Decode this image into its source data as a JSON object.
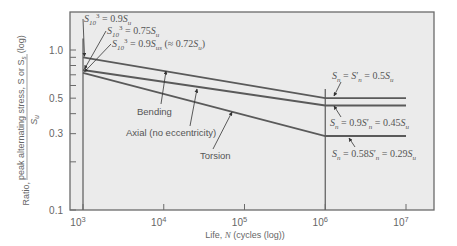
{
  "chart_data": {
    "type": "line",
    "title": "",
    "xlabel": "Life, N (cycles (log))",
    "ylabel": "Ratio, peak alternating stress, S or S_s / S_u (log)",
    "ylabel_parts": {
      "prefix": "Ratio,",
      "numerator": "peak alternating stress, S or S",
      "numerator_sub": "s",
      "denominator": "S",
      "denominator_sub": "u",
      "suffix": "(log)"
    },
    "xscale": "log",
    "yscale": "log",
    "xlim": [
      1000,
      20000000
    ],
    "ylim": [
      0.1,
      1.35
    ],
    "grid": false,
    "x_ticks": [
      {
        "value": 1000,
        "label_base": "10",
        "label_exp": "3"
      },
      {
        "value": 10000,
        "label_base": "10",
        "label_exp": "4"
      },
      {
        "value": 100000,
        "label_base": "10",
        "label_exp": "5"
      },
      {
        "value": 1000000,
        "label_base": "10",
        "label_exp": "6"
      },
      {
        "value": 10000000,
        "label_base": "10",
        "label_exp": "7"
      }
    ],
    "y_ticks_major": [
      {
        "value": 1.0,
        "label": "1.0"
      },
      {
        "value": 0.5,
        "label": "0.5"
      },
      {
        "value": 0.3,
        "label": "0.3"
      },
      {
        "value": 0.1,
        "label": "0.1"
      }
    ],
    "y_ticks_minor": [
      0.9,
      0.8,
      0.7,
      0.6,
      0.4,
      0.2
    ],
    "series": [
      {
        "name": "Bending",
        "x": [
          1000,
          1000000,
          10000000
        ],
        "y": [
          0.9,
          0.5,
          0.5
        ]
      },
      {
        "name": "Axial (no eccentricity)",
        "x": [
          1000,
          1000000,
          10000000
        ],
        "y": [
          0.75,
          0.45,
          0.45
        ]
      },
      {
        "name": "Torsion",
        "x": [
          1000,
          1000000,
          10000000
        ],
        "y": [
          0.72,
          0.29,
          0.29
        ]
      }
    ],
    "reference_lines": [
      {
        "orientation": "vertical",
        "x": 1000,
        "y_from": 0.1,
        "y_to": 1.18
      },
      {
        "orientation": "vertical",
        "x": 1000000,
        "y_from": 0.1,
        "y_to": 0.57
      }
    ],
    "annotations": [
      {
        "id": "s103_bending",
        "parts": [
          [
            "S",
            ""
          ],
          [
            "10",
            "sub"
          ],
          [
            "3",
            "sup"
          ],
          [
            " = 0.9",
            ""
          ],
          [
            "S",
            ""
          ],
          [
            "u",
            "sub"
          ]
        ],
        "text": "S_10^3 = 0.9S_u",
        "x": 84,
        "y": 22,
        "arrow_to_series": "Bending"
      },
      {
        "id": "s103_axial",
        "parts": [
          [
            "S",
            ""
          ],
          [
            "10",
            "sub"
          ],
          [
            "3",
            "sup"
          ],
          [
            " = 0.75",
            ""
          ],
          [
            "S",
            ""
          ],
          [
            "u",
            "sub"
          ]
        ],
        "text": "S_10^3 = 0.75S_u",
        "x": 107,
        "y": 34,
        "arrow_to_series": "Axial (no eccentricity)"
      },
      {
        "id": "s103_torsion",
        "parts": [
          [
            "S",
            ""
          ],
          [
            "10",
            "sub"
          ],
          [
            "3",
            "sup"
          ],
          [
            " = 0.9",
            ""
          ],
          [
            "S",
            ""
          ],
          [
            "us",
            "sub"
          ],
          [
            " (≈ 0.72",
            ""
          ],
          [
            "S",
            ""
          ],
          [
            "u",
            "sub"
          ],
          [
            ")",
            ""
          ]
        ],
        "text": "S_10^3 = 0.9S_us (≈ 0.72S_u)",
        "x": 112,
        "y": 47,
        "arrow_to_series": "Torsion"
      },
      {
        "id": "sn_bending",
        "parts": [
          [
            "S",
            ""
          ],
          [
            "n",
            "sub"
          ],
          [
            " = ",
            ""
          ],
          [
            "S",
            ""
          ],
          [
            "′",
            ""
          ],
          [
            "n",
            "sub"
          ],
          [
            " = 0.5",
            ""
          ],
          [
            "S",
            ""
          ],
          [
            "u",
            "sub"
          ]
        ],
        "text": "S_n = S'_n = 0.5S_u",
        "x": 332,
        "y": 79
      },
      {
        "id": "sn_axial",
        "parts": [
          [
            "S",
            ""
          ],
          [
            "n",
            "sub"
          ],
          [
            " = 0.9",
            ""
          ],
          [
            "S",
            ""
          ],
          [
            "′",
            ""
          ],
          [
            "n",
            "sub"
          ],
          [
            " = 0.45",
            ""
          ],
          [
            "S",
            ""
          ],
          [
            "u",
            "sub"
          ]
        ],
        "text": "S_n = 0.9S'_n = 0.45S_u",
        "x": 330,
        "y": 126
      },
      {
        "id": "sn_torsion",
        "parts": [
          [
            "S",
            ""
          ],
          [
            "n",
            "sub"
          ],
          [
            " = 0.58",
            ""
          ],
          [
            "S",
            ""
          ],
          [
            "′",
            ""
          ],
          [
            "n",
            "sub"
          ],
          [
            " = 0.29",
            ""
          ],
          [
            "S",
            ""
          ],
          [
            "u",
            "sub"
          ]
        ],
        "text": "S_n = 0.58S'_n = 0.29S_u",
        "x": 332,
        "y": 157
      }
    ],
    "curve_labels": [
      {
        "series": "Bending",
        "text": "Bending",
        "x": 137,
        "y": 115,
        "arrow": [
          161,
          104,
          166,
          71
        ]
      },
      {
        "series": "Axial (no eccentricity)",
        "text": "Axial (no eccentricity)",
        "x": 126,
        "y": 136,
        "arrow": [
          190,
          126,
          197,
          89
        ]
      },
      {
        "series": "Torsion",
        "text": "Torsion",
        "x": 200,
        "y": 159,
        "arrow": [
          213,
          149,
          232,
          112
        ]
      }
    ],
    "colors": {
      "plot_background": "#ebebeb",
      "frame": "#6a6a6a",
      "line": "#5a5a5a",
      "text": "#555555"
    }
  }
}
